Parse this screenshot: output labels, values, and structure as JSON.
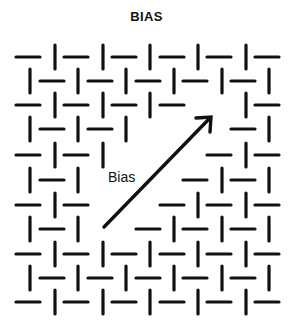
{
  "title": "BIAS",
  "arrow_label": "Bias",
  "colors": {
    "ink": "#111111",
    "background": "#ffffff"
  },
  "grid": {
    "row_y": [
      57,
      81,
      105,
      129,
      155,
      180,
      205,
      229,
      254,
      278,
      302
    ],
    "odd_row": {
      "horizontal_x": [
        28,
        76,
        124,
        172,
        219,
        267
      ],
      "vertical_x": [
        55,
        103,
        150,
        198,
        246
      ]
    },
    "even_row": {
      "vertical_x": [
        30,
        78,
        126,
        174,
        222,
        269
      ],
      "horizontal_x": [
        52,
        100,
        148,
        195,
        243
      ]
    },
    "dash_half_length": 12,
    "stroke_width": 3.2,
    "missing": [
      [],
      [],
      [
        "V198",
        "H219"
      ],
      [
        "H148",
        "V174",
        "H195",
        "V222"
      ],
      [
        "H124",
        "V150",
        "H172",
        "V198"
      ],
      [
        "H100",
        "V126",
        "H148",
        "V174"
      ],
      [
        "V103",
        "H124",
        "V150"
      ],
      [
        "H100",
        "V126"
      ],
      [],
      [],
      []
    ]
  },
  "arrow": {
    "x1": 104,
    "y1": 227,
    "x2": 211,
    "y2": 117
  }
}
